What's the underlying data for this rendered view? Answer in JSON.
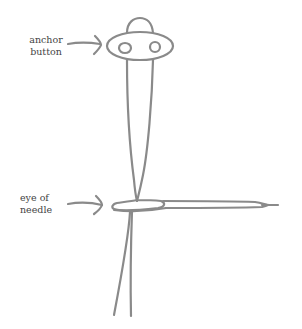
{
  "diagram": {
    "title": "",
    "labels": {
      "anchor_button": [
        "anchor",
        "button"
      ],
      "eye_of_needle": [
        "eye of",
        "needle"
      ]
    },
    "stroke_color": "#8a8a8a",
    "text_color": "#444444",
    "components": [
      "anchor-button",
      "thread-loop",
      "needle",
      "thread-tail"
    ]
  }
}
